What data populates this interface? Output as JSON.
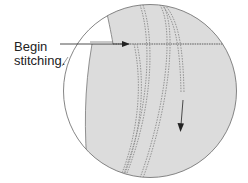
{
  "diagram": {
    "label": {
      "line1": "Begin",
      "line2": "stitching."
    },
    "colors": {
      "fabric": "#dcdcdc",
      "outline": "#777777",
      "stitch": "#8a8a8a",
      "arrow": "#222222",
      "background": "#ffffff"
    },
    "elements": [
      "magnified-circle-view",
      "fabric-panel",
      "topstitch-line-horizontal",
      "double-stitch-seam-left",
      "double-stitch-seam-right",
      "short-stitch-line",
      "begin-arrow",
      "direction-arrow-down"
    ]
  }
}
